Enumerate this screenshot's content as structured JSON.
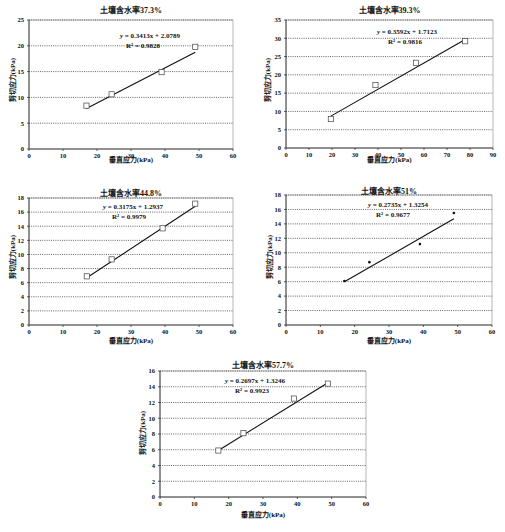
{
  "chart_data": [
    {
      "type": "scatter",
      "title": "土壤含水率37.3%",
      "xlabel": "垂直应力(kPa)",
      "ylabel": "剪切应力(kPa)",
      "xlim": [
        0,
        60
      ],
      "ylim": [
        0,
        25
      ],
      "xticks": [
        0,
        10,
        20,
        30,
        40,
        50,
        60
      ],
      "yticks": [
        0,
        5,
        10,
        15,
        20,
        25
      ],
      "grid": "horizontal dotted",
      "marker": "square",
      "x": [
        16.9,
        24.3,
        39.0,
        48.9
      ],
      "y": [
        8.4,
        10.6,
        14.9,
        19.8
      ],
      "trendline": {
        "slope": 0.3413,
        "intercept": 2.0789,
        "equation": "y = 0.3413x + 2.0789",
        "r2": "R² = 0.9828"
      }
    },
    {
      "type": "scatter",
      "title": "土壤含水率39.3%",
      "xlabel": "垂直应力(kPa)",
      "ylabel": "剪切应力(kPa)",
      "xlim": [
        0,
        90
      ],
      "ylim": [
        0,
        35
      ],
      "xticks": [
        0,
        10,
        20,
        30,
        40,
        50,
        60,
        70,
        80,
        90
      ],
      "yticks": [
        0,
        5,
        10,
        15,
        20,
        25,
        30,
        35
      ],
      "grid": "horizontal dotted",
      "marker": "square",
      "x": [
        19.5,
        38.9,
        56.5,
        77.9
      ],
      "y": [
        7.9,
        17.2,
        23.3,
        29.2
      ],
      "trendline": {
        "slope": 0.3592,
        "intercept": 1.7123,
        "equation": "y = 0.3592x + 1.7123",
        "r2": "R² = 0.9816"
      }
    },
    {
      "type": "scatter",
      "title": "土壤含水率44.8%",
      "xlabel": "垂直应力(kPa)",
      "ylabel": "剪切应力(kPa)",
      "xlim": [
        0,
        60
      ],
      "ylim": [
        0,
        18
      ],
      "xticks": [
        0,
        10,
        20,
        30,
        40,
        50,
        60
      ],
      "yticks": [
        0,
        2,
        4,
        6,
        8,
        10,
        12,
        14,
        16,
        18
      ],
      "grid": "horizontal dotted",
      "marker": "square",
      "x": [
        17.0,
        24.3,
        39.3,
        48.9
      ],
      "y": [
        6.9,
        9.3,
        13.7,
        17.2
      ],
      "trendline": {
        "slope": 0.3175,
        "intercept": 1.2937,
        "equation": "y = 0.3175x + 1.2937",
        "r2": "R² = 0.9979"
      }
    },
    {
      "type": "scatter",
      "title": "土壤含水率51%",
      "xlabel": "垂直应力(kPa)",
      "ylabel": "剪切应力(kPa)",
      "xlim": [
        0,
        60
      ],
      "ylim": [
        0,
        18
      ],
      "xticks": [
        0,
        10,
        20,
        30,
        40,
        50,
        60
      ],
      "yticks": [
        0,
        2,
        4,
        6,
        8,
        10,
        12,
        14,
        16,
        18
      ],
      "grid": "horizontal dotted",
      "marker": "dot",
      "x": [
        17.0,
        24.3,
        39.0,
        48.9
      ],
      "y": [
        6.1,
        8.7,
        11.2,
        15.5
      ],
      "trendline": {
        "slope": 0.2735,
        "intercept": 1.3254,
        "equation": "y = 0.2735x + 1.3254",
        "r2": "R² = 0.9677"
      }
    },
    {
      "type": "scatter",
      "title": "土壤含水率57.7%",
      "xlabel": "垂直应力(kPa)",
      "ylabel": "剪切应力(kPa)",
      "xlim": [
        0,
        60
      ],
      "ylim": [
        0,
        16
      ],
      "xticks": [
        0,
        10,
        20,
        30,
        40,
        50,
        60
      ],
      "yticks": [
        0,
        2,
        4,
        6,
        8,
        10,
        12,
        14,
        16
      ],
      "grid": "horizontal dotted",
      "marker": "square",
      "x": [
        17.0,
        24.3,
        39.0,
        48.9
      ],
      "y": [
        5.9,
        8.1,
        12.5,
        14.4
      ],
      "trendline": {
        "slope": 0.2697,
        "intercept": 1.3246,
        "equation": "y = 0.2697x + 1.3246",
        "r2": "R² = 0.9923"
      }
    }
  ],
  "charts": [
    {
      "title": "土壤含水率37.3%",
      "xlabel": "垂直应力(kPa)",
      "ylabel": "剪切应力(kPa)",
      "eq_prefix": "y",
      "eq_body": " = 0.3413x + 2.0789",
      "r2": "R² = 0.9828"
    },
    {
      "title": "土壤含水率39.3%",
      "xlabel": "垂直应力(kPa)",
      "ylabel": "剪切应力(kPa)",
      "eq_prefix": "y",
      "eq_body": " = 0.3592x + 1.7123",
      "r2": "R² = 0.9816"
    },
    {
      "title": "土壤含水率44.8%",
      "xlabel": "垂直应力(kPa)",
      "ylabel": "剪切应力(kPa)",
      "eq_prefix": "y",
      "eq_body": " = 0.3175x + 1.2937",
      "r2": "R² = 0.9979"
    },
    {
      "title": "土壤含水率51%",
      "xlabel": "垂直应力(kPa)",
      "ylabel": "剪切应力(kPa)",
      "eq_prefix": "y",
      "eq_body": " = 0.2735x + 1.3254",
      "r2": "R² = 0.9677"
    },
    {
      "title": "土壤含水率57.7%",
      "xlabel": "垂直应力(kPa)",
      "ylabel": "剪切应力(kPa)",
      "eq_prefix": "y",
      "eq_body": " = 0.2697x + 1.3246",
      "r2": "R² = 0.9923"
    }
  ]
}
